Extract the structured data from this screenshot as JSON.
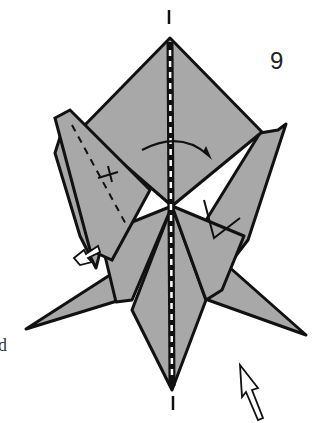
{
  "diagram": {
    "type": "origami-step",
    "step_number": "9",
    "edge_text": "d",
    "colors": {
      "paper": "#a8a8a8",
      "line": "#111111",
      "background": "#ffffff"
    },
    "symbols": [
      "valley-fold-line",
      "fold-arrow-curved",
      "push-arrow-left",
      "push-arrow-bottom-right",
      "center-crease-dash",
      "axis-marks"
    ]
  }
}
